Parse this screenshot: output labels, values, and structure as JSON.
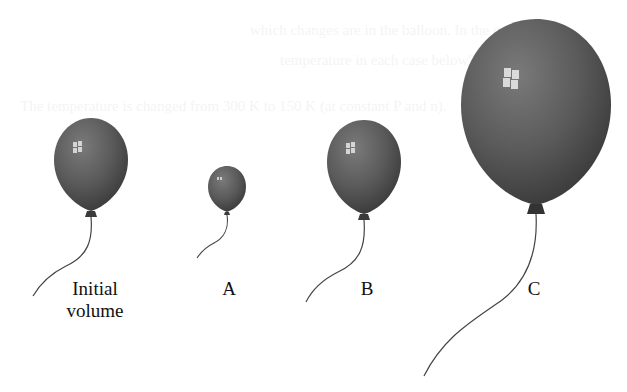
{
  "figure": {
    "balloons": [
      {
        "id": "initial",
        "label_lines": [
          "Initial",
          "volume"
        ],
        "size": "medium"
      },
      {
        "id": "A",
        "label_lines": [
          "A"
        ],
        "size": "small"
      },
      {
        "id": "B",
        "label_lines": [
          "B"
        ],
        "size": "medium"
      },
      {
        "id": "C",
        "label_lines": [
          "C"
        ],
        "size": "large"
      }
    ],
    "colors": {
      "balloon_fill": "#5a5a5a",
      "balloon_dark": "#3a3a3a",
      "highlight": "#e8e8e8",
      "string": "#444444",
      "label": "#111111"
    }
  }
}
